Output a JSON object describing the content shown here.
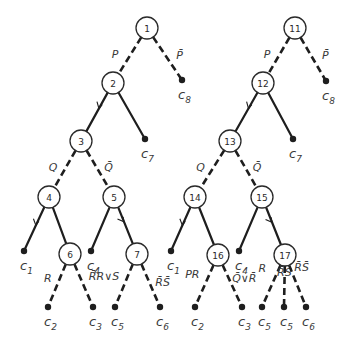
{
  "diagram": {
    "title": "",
    "trees": [
      {
        "name": "left-tree",
        "nodes": [
          {
            "id": "1",
            "label": "1"
          },
          {
            "id": "2",
            "label": "2"
          },
          {
            "id": "3",
            "label": "3"
          },
          {
            "id": "4",
            "label": "4"
          },
          {
            "id": "5",
            "label": "5"
          },
          {
            "id": "6",
            "label": "6"
          },
          {
            "id": "7",
            "label": "7"
          }
        ],
        "leaves": [
          {
            "id": "L8",
            "base": "c",
            "sub": "8"
          },
          {
            "id": "L7",
            "base": "c",
            "sub": "7"
          },
          {
            "id": "L1",
            "base": "c",
            "sub": "1"
          },
          {
            "id": "L4",
            "base": "c",
            "sub": "4"
          },
          {
            "id": "L2",
            "base": "c",
            "sub": "2"
          },
          {
            "id": "L3",
            "base": "c",
            "sub": "3"
          },
          {
            "id": "L5",
            "base": "c",
            "sub": "5"
          },
          {
            "id": "L6",
            "base": "c",
            "sub": "6"
          }
        ],
        "edges": [
          {
            "from": "1",
            "to": "2",
            "style": "dashed",
            "label": "P"
          },
          {
            "from": "1",
            "to": "L8",
            "style": "dashed",
            "label": "P̄"
          },
          {
            "from": "2",
            "to": "3",
            "style": "solid",
            "label": "",
            "arrow": true
          },
          {
            "from": "2",
            "to": "L7",
            "style": "solid",
            "label": ""
          },
          {
            "from": "3",
            "to": "4",
            "style": "dashed",
            "label": "Q"
          },
          {
            "from": "3",
            "to": "5",
            "style": "dashed",
            "label": "Q̄"
          },
          {
            "from": "4",
            "to": "L1",
            "style": "solid",
            "label": "",
            "arrow": true
          },
          {
            "from": "4",
            "to": "6",
            "style": "solid",
            "label": ""
          },
          {
            "from": "5",
            "to": "L4",
            "style": "solid",
            "label": ""
          },
          {
            "from": "5",
            "to": "7",
            "style": "solid",
            "label": "",
            "arrow": true
          },
          {
            "from": "6",
            "to": "L2",
            "style": "dashed",
            "label": "R"
          },
          {
            "from": "6",
            "to": "L3",
            "style": "dashed",
            "label": "R̄"
          },
          {
            "from": "7",
            "to": "L5",
            "style": "dashed",
            "label": "R∨S"
          },
          {
            "from": "7",
            "to": "L6",
            "style": "dashed",
            "label": "R̄S̄"
          }
        ]
      },
      {
        "name": "right-tree",
        "nodes": [
          {
            "id": "11",
            "label": "11"
          },
          {
            "id": "12",
            "label": "12"
          },
          {
            "id": "13",
            "label": "13"
          },
          {
            "id": "14",
            "label": "14"
          },
          {
            "id": "15",
            "label": "15"
          },
          {
            "id": "16",
            "label": "16"
          },
          {
            "id": "17",
            "label": "17"
          }
        ],
        "leaves": [
          {
            "id": "L8",
            "base": "c",
            "sub": "8"
          },
          {
            "id": "L7",
            "base": "c",
            "sub": "7"
          },
          {
            "id": "L1",
            "base": "c",
            "sub": "1"
          },
          {
            "id": "L4",
            "base": "c",
            "sub": "4"
          },
          {
            "id": "L2",
            "base": "c",
            "sub": "2"
          },
          {
            "id": "L3",
            "base": "c",
            "sub": "3"
          },
          {
            "id": "L5a",
            "base": "c",
            "sub": "5"
          },
          {
            "id": "L5b",
            "base": "c",
            "sub": "5"
          },
          {
            "id": "L6",
            "base": "c",
            "sub": "6"
          }
        ],
        "edges": [
          {
            "from": "11",
            "to": "12",
            "style": "dashed",
            "label": "P"
          },
          {
            "from": "11",
            "to": "L8",
            "style": "dashed",
            "label": "P̄"
          },
          {
            "from": "12",
            "to": "13",
            "style": "solid",
            "label": "",
            "arrow": true
          },
          {
            "from": "12",
            "to": "L7",
            "style": "solid",
            "label": ""
          },
          {
            "from": "13",
            "to": "14",
            "style": "dashed",
            "label": "Q"
          },
          {
            "from": "13",
            "to": "15",
            "style": "dashed",
            "label": "Q̄"
          },
          {
            "from": "14",
            "to": "L1",
            "style": "solid",
            "label": "",
            "arrow": true
          },
          {
            "from": "14",
            "to": "16",
            "style": "solid",
            "label": ""
          },
          {
            "from": "15",
            "to": "L4",
            "style": "solid",
            "label": ""
          },
          {
            "from": "15",
            "to": "17",
            "style": "solid",
            "label": "",
            "arrow": true
          },
          {
            "from": "16",
            "to": "L2",
            "style": "dashed",
            "label": "PR"
          },
          {
            "from": "16",
            "to": "L3",
            "style": "dashed",
            "label": "Q̄∨R̄"
          },
          {
            "from": "17",
            "to": "L5a",
            "style": "dashed",
            "label": "R"
          },
          {
            "from": "17",
            "to": "L5b",
            "style": "dashed",
            "label": "R̄S"
          },
          {
            "from": "17",
            "to": "L6",
            "style": "dashed",
            "label": "R̄S̄"
          }
        ]
      }
    ]
  }
}
